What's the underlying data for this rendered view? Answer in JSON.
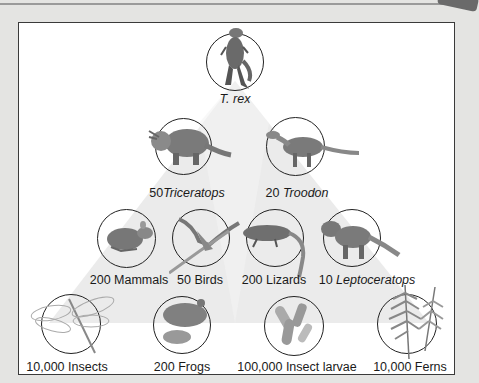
{
  "colors": {
    "background": "#e4e4e2",
    "panel": "#ffffff",
    "pyramid": "#ebebeb",
    "border": "#3a3a3a"
  },
  "levels": [
    {
      "level": 1,
      "nodes": [
        {
          "id": "trex",
          "count": "",
          "name": "T. rex",
          "italic": true,
          "icon": "tyrannosaurus-icon"
        }
      ]
    },
    {
      "level": 2,
      "nodes": [
        {
          "id": "triceratops",
          "count": "50",
          "name": "Triceratops",
          "italic": true,
          "icon": "triceratops-icon"
        },
        {
          "id": "troodon",
          "count": "20",
          "name": "Troodon",
          "italic": true,
          "icon": "troodon-icon"
        }
      ]
    },
    {
      "level": 3,
      "nodes": [
        {
          "id": "mammals",
          "count": "200",
          "name": "Mammals",
          "italic": false,
          "icon": "mammal-icon"
        },
        {
          "id": "birds",
          "count": "50",
          "name": "Birds",
          "italic": false,
          "icon": "bird-icon"
        },
        {
          "id": "lizards",
          "count": "200",
          "name": "Lizards",
          "italic": false,
          "icon": "lizard-icon"
        },
        {
          "id": "leptoceratops",
          "count": "10",
          "name": "Leptoceratops",
          "italic": true,
          "icon": "leptoceratops-icon"
        }
      ]
    },
    {
      "level": 4,
      "nodes": [
        {
          "id": "insects",
          "count": "10,000",
          "name": "Insects",
          "italic": false,
          "icon": "dragonfly-icon"
        },
        {
          "id": "frogs",
          "count": "200",
          "name": "Frogs",
          "italic": false,
          "icon": "frog-icon"
        },
        {
          "id": "larvae",
          "count": "100,000",
          "name": "Insect larvae",
          "italic": false,
          "icon": "larvae-icon"
        },
        {
          "id": "ferns",
          "count": "10,000",
          "name": "Ferns",
          "italic": false,
          "icon": "fern-icon"
        }
      ]
    }
  ],
  "labels": {
    "trex": "T. rex",
    "triceratops_count": "50",
    "triceratops_name": "Triceratops",
    "troodon_count": "20",
    "troodon_name": "Troodon",
    "mammals": "200 Mammals",
    "birds": "50 Birds",
    "lizards": "200 Lizards",
    "leptoceratops_count": "10",
    "leptoceratops_name": "Leptoceratops",
    "insects": "10,000 Insects",
    "frogs": "200 Frogs",
    "larvae": "100,000 Insect larvae",
    "ferns": "10,000 Ferns"
  }
}
